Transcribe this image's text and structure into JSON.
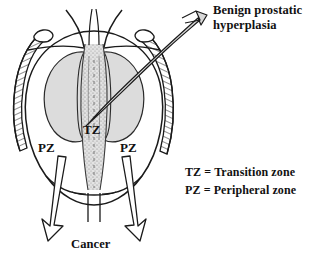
{
  "figure": {
    "kind": "prostate-zonal-anatomy-diagram",
    "labels": {
      "bph_callout": "Benign prostatic\nhyperplasia",
      "transition_zone_abbr": "TZ",
      "peripheral_zone_abbr_left": "PZ",
      "peripheral_zone_abbr_right": "PZ",
      "cancer_callout": "Cancer"
    },
    "legend": {
      "tz_entry": "TZ = Transition zone",
      "pz_entry": "PZ = Peripheral zone"
    },
    "colors": {
      "background": "#ffffff",
      "ink": "#111111",
      "zone_fill": "#dcdcdc",
      "arrow_fill": "#d8d8d8",
      "stipple": "#8a8a8a",
      "capsule_hatch": "#4a4a4a"
    },
    "arrows": {
      "bph_arrow_name": "benign-prostatic-hyperplasia-arrow",
      "cancer_arrow_left_name": "cancer-arrow-left",
      "cancer_arrow_right_name": "cancer-arrow-right"
    }
  }
}
